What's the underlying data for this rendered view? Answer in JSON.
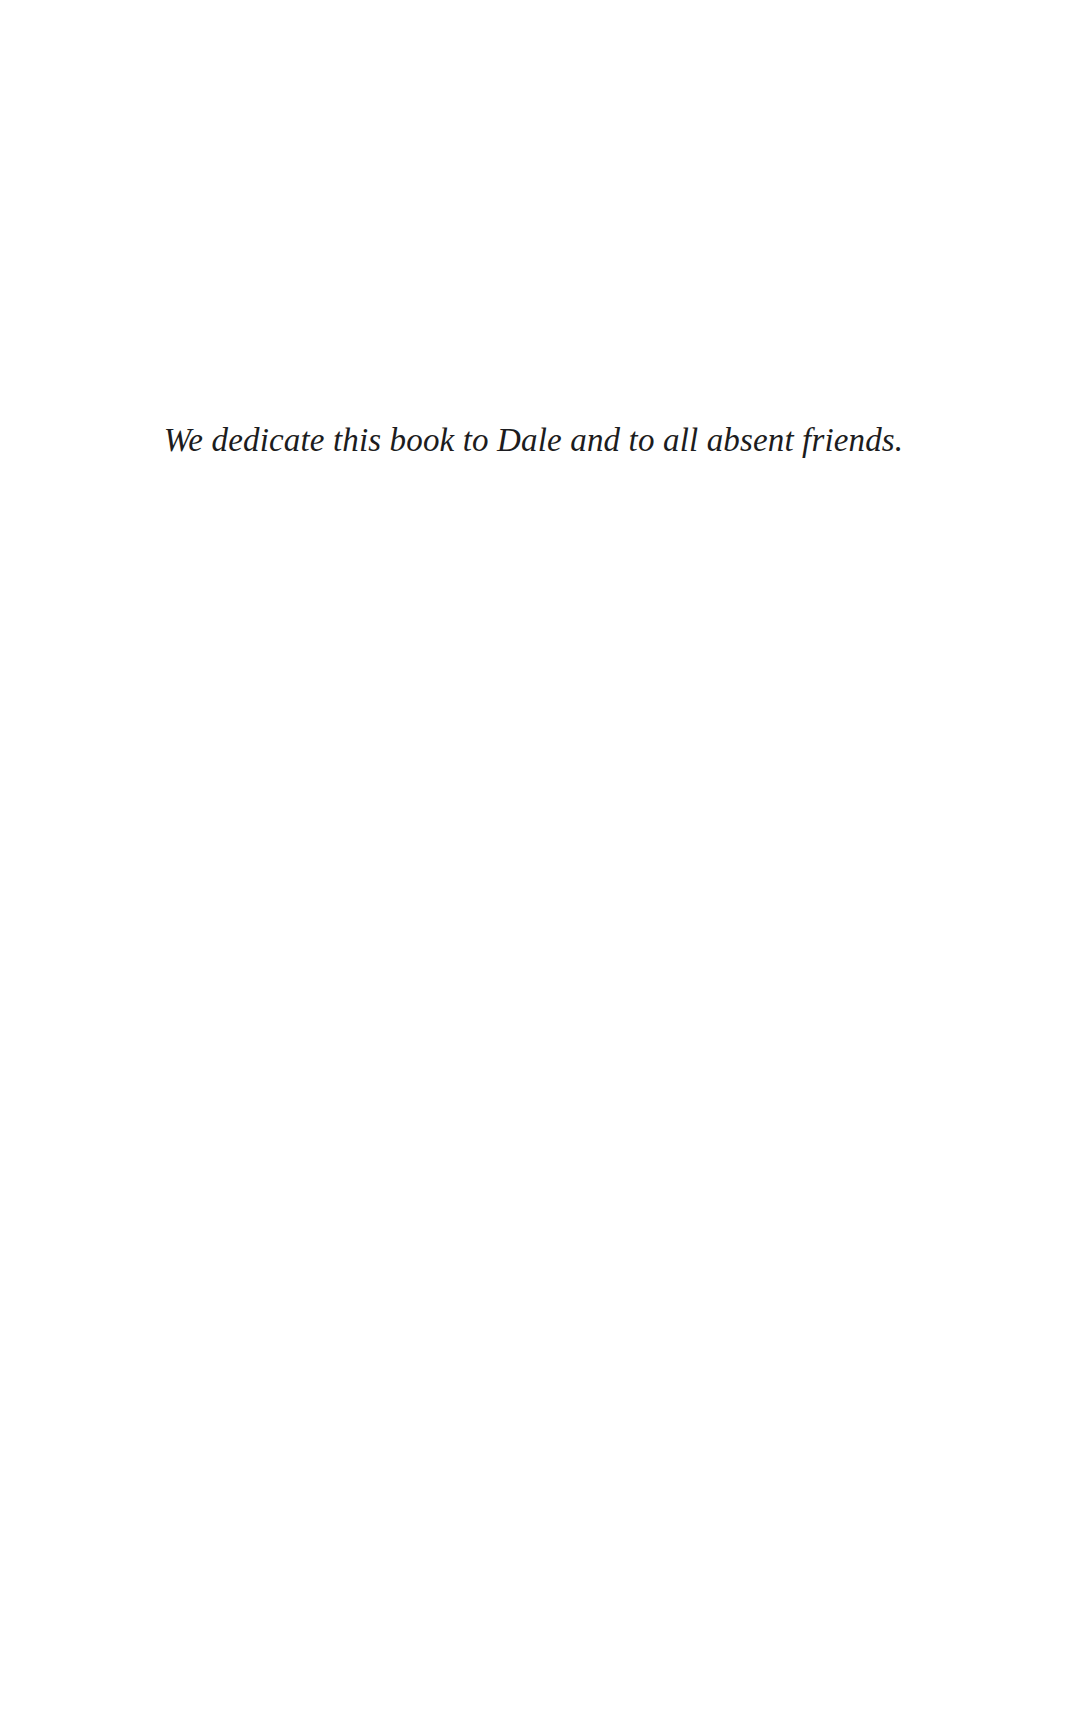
{
  "page": {
    "kind": "book-dedication-page",
    "background_color": "#ffffff",
    "text_color": "#1c1c20",
    "width": 1073,
    "height": 1716
  },
  "dedication": {
    "text": "We dedicate this book to Dale and to all absent friends.",
    "style": "italic-serif",
    "alignment": "center"
  }
}
